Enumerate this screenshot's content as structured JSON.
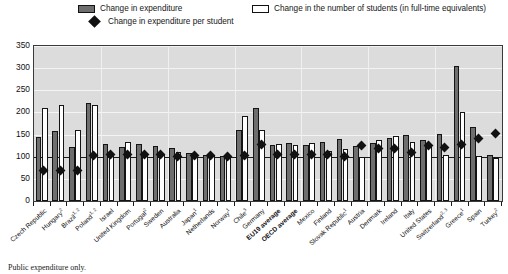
{
  "legend": {
    "items": [
      {
        "key": "expenditure",
        "label": "Change in expenditure",
        "icon": "filled-bar-swatch"
      },
      {
        "key": "students",
        "label": "Change in the number of students (in full-time equivalents)",
        "icon": "open-bar-swatch"
      },
      {
        "key": "per_student",
        "label": "Change in expenditure per student",
        "icon": "diamond-marker"
      }
    ]
  },
  "footnote": "Public expenditure only.",
  "colors": {
    "expenditure_bar": "#6e6e6e",
    "students_bar": "#ffffff",
    "marker": "#111111",
    "plot_background": "#dcdcdc",
    "gridline": "#f4f4f4",
    "axis": "#1a1a1a"
  },
  "chart_data": {
    "type": "bar",
    "title": "",
    "subtitle": "",
    "xlabel": "",
    "ylabel": "",
    "ylim": [
      0,
      350
    ],
    "yticks": [
      0,
      50,
      100,
      150,
      200,
      250,
      300,
      350
    ],
    "grid": true,
    "reference_line": 100,
    "legend_position": "top",
    "categories": [
      "Czech Republic",
      "Hungary",
      "Brazil",
      "Poland",
      "Israel",
      "United Kingdom",
      "Portugal",
      "Sweden",
      "Australia",
      "Japan",
      "Netherlands",
      "Norway",
      "Chile",
      "Germany",
      "EU19 average",
      "OECD average",
      "Mexico",
      "Finland",
      "Slovak Republic",
      "Austria",
      "Denmark",
      "Ireland",
      "Italy",
      "United States",
      "Switzerland",
      "Greece",
      "Spain",
      "Turkey"
    ],
    "category_footnotes": [
      "",
      "2",
      "1, 2",
      "1, 2",
      "",
      "",
      "2",
      "",
      "",
      "1",
      "",
      "1",
      "3",
      "",
      "",
      "",
      "",
      "",
      "1",
      "",
      "",
      "",
      "",
      "",
      "2, 3",
      "1",
      "",
      "2"
    ],
    "bold_categories": [
      "EU19 average",
      "OCDE average",
      "OECD average"
    ],
    "series": [
      {
        "name": "Change in expenditure",
        "values": [
          145,
          157,
          123,
          222,
          128,
          122,
          128,
          124,
          119,
          109,
          104,
          101,
          160,
          210,
          127,
          131,
          127,
          133,
          141,
          125,
          131,
          142,
          148,
          138,
          152,
          305,
          168,
          105
        ]
      },
      {
        "name": "Change in the number of students (in full-time equivalents)",
        "values": [
          210,
          216,
          161,
          217,
          102,
          133,
          108,
          104,
          110,
          104,
          101,
          102,
          192,
          160,
          129,
          126,
          130,
          112,
          117,
          100,
          138,
          146,
          134,
          127,
          104,
          200,
          102,
          98
        ]
      },
      {
        "name": "Change in expenditure per student",
        "values": [
          69,
          70,
          70,
          103,
          104,
          106,
          104,
          104,
          100,
          103,
          103,
          100,
          103,
          128,
          105,
          106,
          104,
          106,
          100,
          125,
          118,
          118,
          110,
          126,
          120,
          128,
          141,
          152
        ],
        "marker": "diamond"
      }
    ]
  }
}
